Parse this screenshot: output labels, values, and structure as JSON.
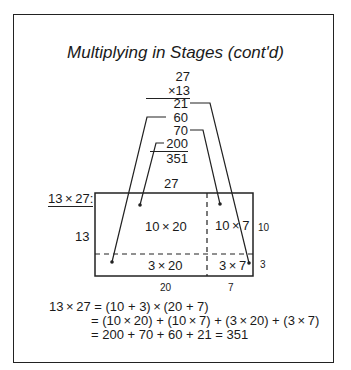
{
  "title": "Multiplying in Stages (cont'd)",
  "stacked_multiplication": {
    "multiplicand": "27",
    "multiplier": "×13",
    "partials": [
      "21",
      "60",
      "70",
      "200"
    ],
    "total": "351"
  },
  "area_model": {
    "label": "13 × 27:",
    "top_label": "27",
    "left_label": "13",
    "cells": {
      "top_left": "10 × 20",
      "top_right": "10 × 7",
      "bottom_left": "3 × 20",
      "bottom_right": "3 × 7"
    },
    "right_labels": [
      "10",
      "3"
    ],
    "bottom_labels": [
      "20",
      "7"
    ]
  },
  "equations": [
    "13 × 27 = (10 + 3) × (20 + 7)",
    "= (10 × 20) + (10 × 7) + (3 × 20) + (3 × 7)",
    "= 200 + 70 + 60 + 21 = 351"
  ]
}
